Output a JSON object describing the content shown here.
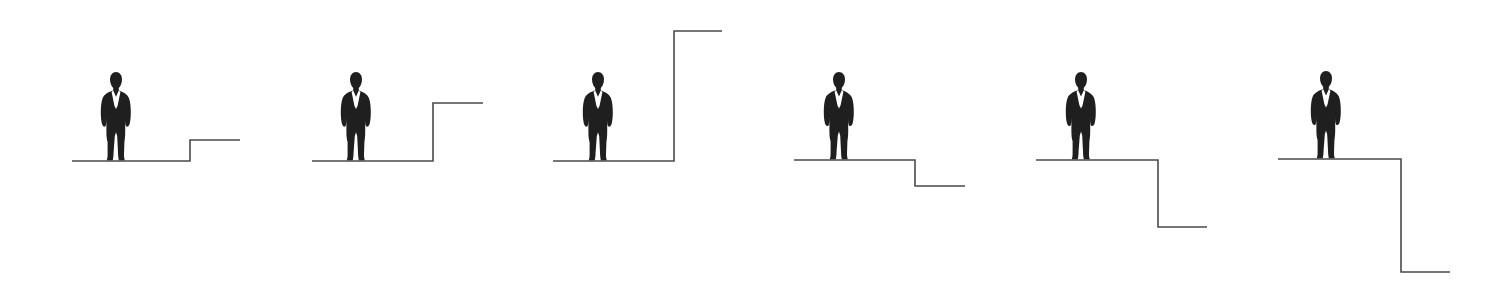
{
  "canvas": {
    "width": 1503,
    "height": 281,
    "background": "#ffffff"
  },
  "style": {
    "line_color": "#4a4a4a",
    "line_width": 1.6,
    "figure_color": "#1f1f1f",
    "shirt_color": "#ffffff"
  },
  "scene": {
    "description": "Six panels, each showing a businessman silhouette standing on a ground line beside a step. The first three panels step upward with increasing height; the last three panels step downward with increasing depth.",
    "panels": [
      {
        "id": "panel-1",
        "label": "small-step-up",
        "direction": "up",
        "step_offset": -21,
        "ground_y": 161,
        "ground_x_start": 72,
        "riser_x": 190,
        "run_x_end": 240,
        "figure": {
          "x": 96,
          "y": 72,
          "width": 40,
          "height": 89
        }
      },
      {
        "id": "panel-2",
        "label": "medium-step-up",
        "direction": "up",
        "step_offset": -58,
        "ground_y": 161,
        "ground_x_start": 312,
        "riser_x": 433,
        "run_x_end": 483,
        "figure": {
          "x": 336,
          "y": 72,
          "width": 40,
          "height": 89
        }
      },
      {
        "id": "panel-3",
        "label": "tall-step-up",
        "direction": "up",
        "step_offset": -130,
        "ground_y": 161,
        "ground_x_start": 553,
        "riser_x": 674,
        "run_x_end": 722,
        "figure": {
          "x": 578,
          "y": 72,
          "width": 40,
          "height": 89
        }
      },
      {
        "id": "panel-4",
        "label": "small-step-down",
        "direction": "down",
        "step_offset": 26,
        "ground_y": 160,
        "ground_x_start": 794,
        "riser_x": 915,
        "run_x_end": 965,
        "figure": {
          "x": 819,
          "y": 72,
          "width": 40,
          "height": 88
        }
      },
      {
        "id": "panel-5",
        "label": "medium-step-down",
        "direction": "down",
        "step_offset": 67,
        "ground_y": 160,
        "ground_x_start": 1036,
        "riser_x": 1158,
        "run_x_end": 1207,
        "figure": {
          "x": 1061,
          "y": 72,
          "width": 40,
          "height": 88
        }
      },
      {
        "id": "panel-6",
        "label": "deep-step-down",
        "direction": "down",
        "step_offset": 113,
        "ground_y": 159,
        "ground_x_start": 1278,
        "riser_x": 1401,
        "run_x_end": 1450,
        "figure": {
          "x": 1306,
          "y": 71,
          "width": 40,
          "height": 88
        }
      }
    ]
  }
}
